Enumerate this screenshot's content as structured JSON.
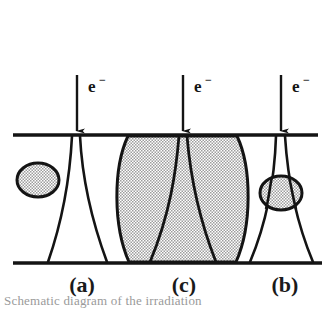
{
  "figure": {
    "type": "schematic-diagram",
    "background_color": "#ffffff",
    "ink_color": "#141414",
    "stipple_color": "#c8c8c8",
    "width": 328,
    "height": 310,
    "beam_labels": [
      {
        "id": "beam-a",
        "text": "e",
        "superscript": "−",
        "arrow_x": 77,
        "arrow_y_start": 75,
        "arrow_y_end": 133
      },
      {
        "id": "beam-c",
        "text": "e",
        "superscript": "−",
        "arrow_x": 183,
        "arrow_y_start": 75,
        "arrow_y_end": 133
      },
      {
        "id": "beam-b",
        "text": "e",
        "superscript": "−",
        "arrow_x": 281,
        "arrow_y_start": 75,
        "arrow_y_end": 133
      }
    ],
    "panel_labels": [
      {
        "id": "panel-a",
        "text": "(a)",
        "x": 82,
        "y": 290
      },
      {
        "id": "panel-c",
        "text": "(c)",
        "x": 184,
        "y": 290
      },
      {
        "id": "panel-b",
        "text": "(b)",
        "x": 285,
        "y": 290
      }
    ],
    "surfaces": {
      "top_line_y": 135,
      "bottom_line_y": 263,
      "top_line_x1": 13,
      "top_line_x2": 318,
      "bottom_line_x1": 13,
      "bottom_line_x2": 322
    },
    "shapes": [
      {
        "id": "free-ellipse",
        "kind": "stippled-ellipse",
        "cx": 38,
        "cy": 180,
        "rx": 21,
        "ry": 17
      },
      {
        "id": "funnel-a",
        "kind": "funnel-outline",
        "neck_x": 77,
        "bottom_left_x": 48,
        "bottom_right_x": 107
      },
      {
        "id": "barrel-c",
        "kind": "stippled-barrel",
        "left_x": 115,
        "right_x": 248,
        "top_y": 136,
        "bottom_y": 262
      },
      {
        "id": "funnel-c",
        "kind": "funnel-outline",
        "neck_x": 183,
        "bottom_left_x": 150,
        "bottom_right_x": 216
      },
      {
        "id": "funnel-b",
        "kind": "funnel-outline",
        "neck_x": 281,
        "bottom_left_x": 250,
        "bottom_right_x": 313
      },
      {
        "id": "neck-ellipse-b",
        "kind": "stippled-ellipse",
        "cx": 281,
        "cy": 193,
        "rx": 21,
        "ry": 17
      }
    ]
  },
  "caption": {
    "clipped_text": "Schematic diagram of the irradiation"
  }
}
